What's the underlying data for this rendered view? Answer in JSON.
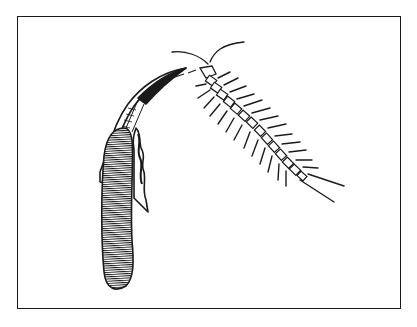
{
  "illustration": {
    "style": "black-and-white line drawing",
    "subjects": [
      "centipede",
      "segmented claw / fang with tooth-like fold"
    ],
    "colors": {
      "ink": "#1a1a1a",
      "paper": "#ffffff"
    },
    "frame": {
      "x": 17,
      "y": 16,
      "width": 384,
      "height": 293
    }
  }
}
